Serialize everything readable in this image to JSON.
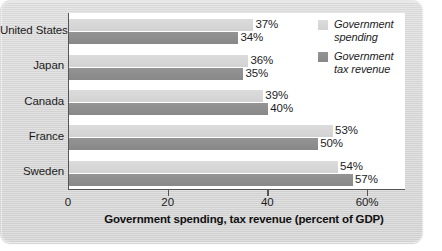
{
  "chart_data": {
    "type": "bar",
    "orientation": "horizontal",
    "title": "",
    "xlabel": "Government spending, tax revenue (percent of GDP)",
    "ylabel": "",
    "categories": [
      "United States",
      "Japan",
      "Canada",
      "France",
      "Sweden"
    ],
    "series": [
      {
        "name": "Government spending",
        "color": "#d5d5d5",
        "values": [
          37,
          36,
          39,
          53,
          54
        ],
        "labels": [
          "37%",
          "36%",
          "39%",
          "53%",
          "54%"
        ]
      },
      {
        "name": "Government tax revenue",
        "color": "#8c8c8c",
        "values": [
          34,
          35,
          40,
          50,
          57
        ],
        "labels": [
          "34%",
          "35%",
          "40%",
          "50%",
          "57%"
        ]
      }
    ],
    "xlim": [
      0,
      67.6
    ],
    "xticks": [
      0,
      20,
      40,
      60
    ],
    "xtick_labels": [
      "0",
      "20",
      "40",
      "60%"
    ],
    "grid": false,
    "legend_position": "top-right"
  },
  "legend": {
    "items": [
      {
        "label": "Government\nspending",
        "swatch": "spending"
      },
      {
        "label": "Government\ntax revenue",
        "swatch": "revenue"
      }
    ]
  },
  "colors": {
    "spending_bar": "#d5d5d5",
    "revenue_bar": "#8c8c8c",
    "panel_background": "#d6d6d6",
    "plot_background": "#ffffff",
    "axis_line": "#555555",
    "text": "#1c1c1c"
  }
}
